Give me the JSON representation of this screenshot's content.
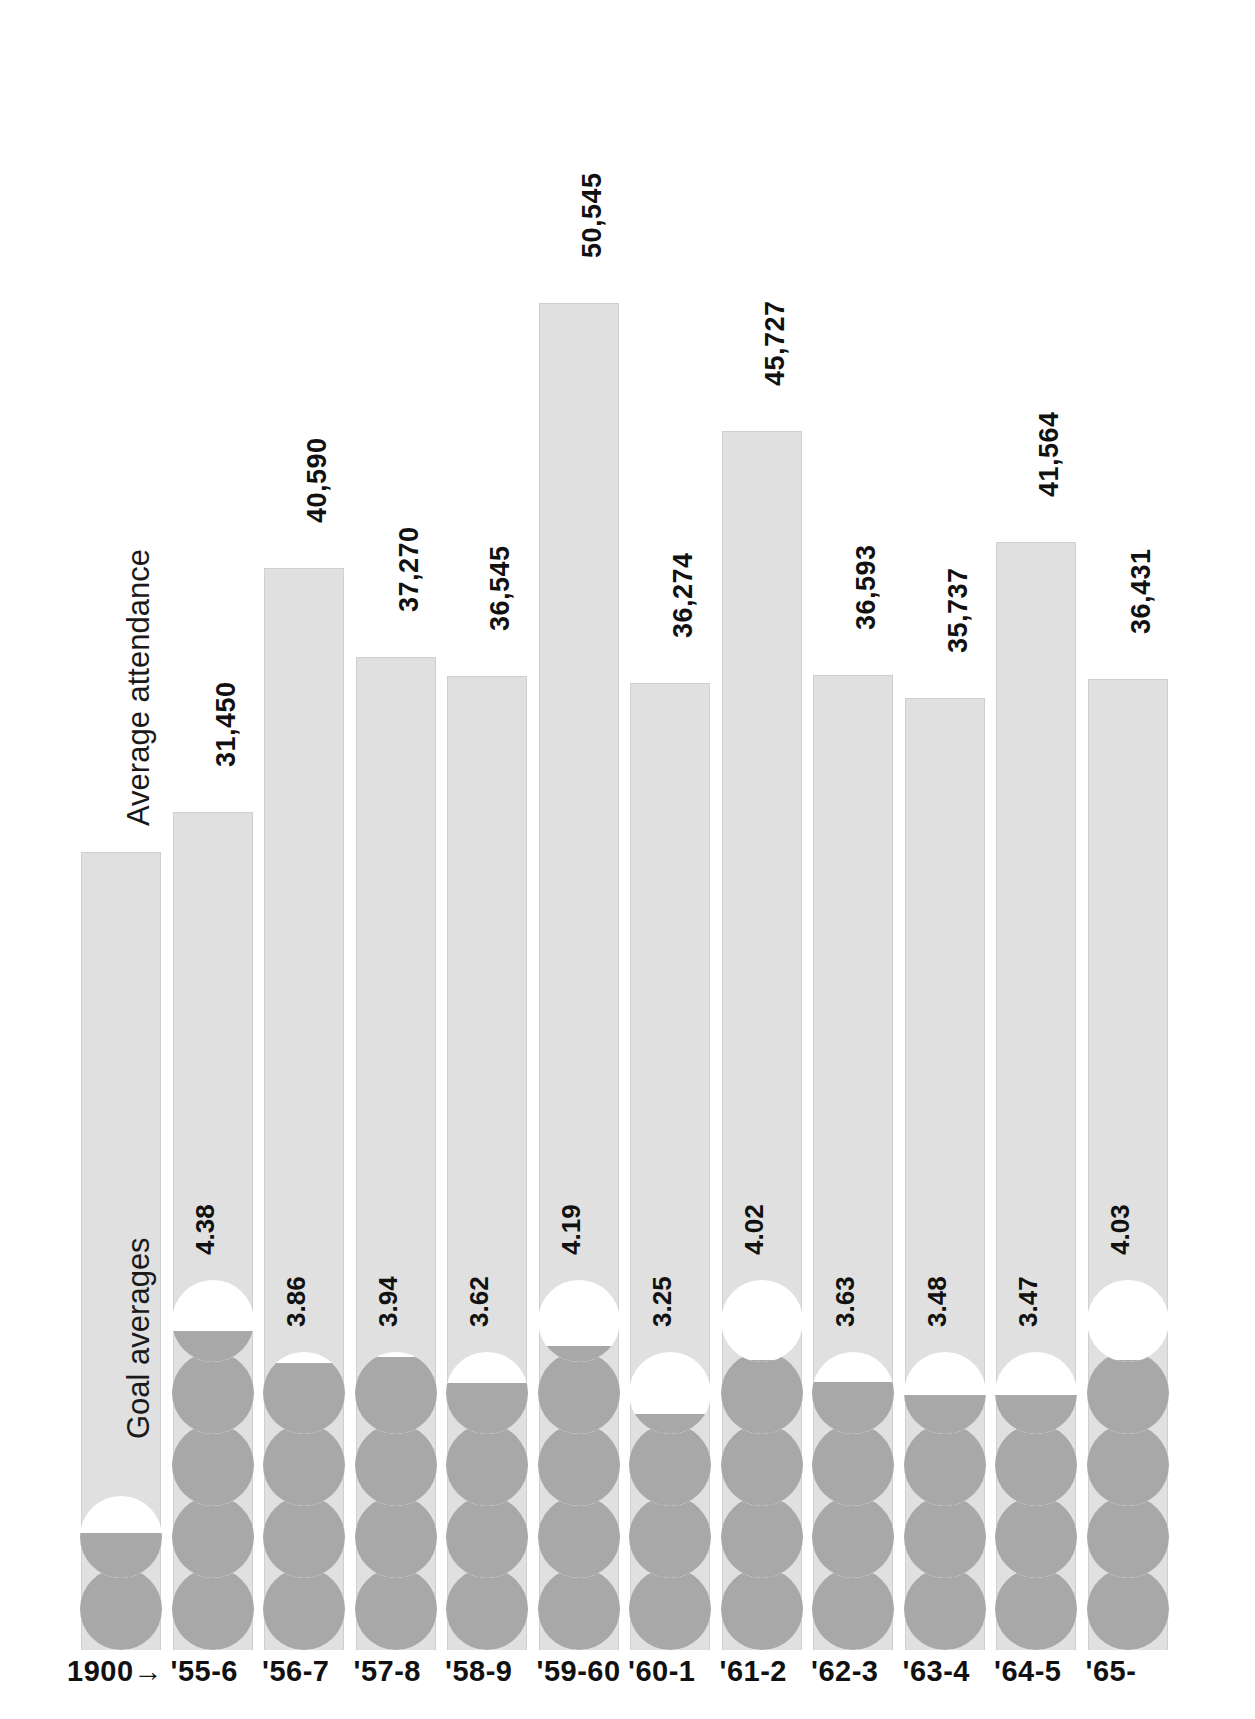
{
  "chart_data": {
    "type": "bar",
    "title": "",
    "xlabel": "",
    "ylabel": "Average attendance",
    "grid": false,
    "legend_position": "in-plot-first-column",
    "axis_note": "1900→",
    "series_labels": {
      "attendance": "Average attendance",
      "goals": "Goal averages"
    },
    "categories": [
      "1900→",
      "'55-6",
      "'56-7",
      "'57-8",
      "'58-9",
      "'59-60",
      "'60-1",
      "'61-2",
      "'62-3",
      "'63-4",
      "'64-5",
      "'65-"
    ],
    "attendance": [
      null,
      31450,
      40590,
      37270,
      36545,
      50545,
      36274,
      45727,
      36593,
      35737,
      41564,
      36431
    ],
    "attendance_labels": [
      "",
      "31,450",
      "40,590",
      "37,270",
      "36,545",
      "50,545",
      "36,274",
      "45,727",
      "36,593",
      "35,737",
      "41,564",
      "36,431"
    ],
    "goal_averages": [
      null,
      4.38,
      3.86,
      3.94,
      3.62,
      4.19,
      3.25,
      4.02,
      3.63,
      3.48,
      3.47,
      4.03
    ],
    "goal_labels": [
      "",
      "4.38",
      "3.86",
      "3.94",
      "3.62",
      "4.19",
      "3.25",
      "4.02",
      "3.63",
      "3.48",
      "3.47",
      "4.03"
    ],
    "ylim": [
      0,
      57000
    ],
    "goal_symbol": "one circle = one goal; partial fill = fractional goal average",
    "colors": {
      "bar": "#e0e0e0",
      "bar_border": "#cfcfcf",
      "circle_fill": "#a8a8a8",
      "circle_empty": "#ffffff",
      "text": "#111111",
      "background": "#ffffff"
    }
  },
  "columns": [
    {
      "key": "legend",
      "xlabel": "1900→",
      "attendance_label": "",
      "goal_label": ""
    },
    {
      "key": "1955-56",
      "xlabel": "'55-6",
      "attendance_label": "31,450",
      "goal_label": "4.38"
    },
    {
      "key": "1956-57",
      "xlabel": "'56-7",
      "attendance_label": "40,590",
      "goal_label": "3.86"
    },
    {
      "key": "1957-58",
      "xlabel": "'57-8",
      "attendance_label": "37,270",
      "goal_label": "3.94"
    },
    {
      "key": "1958-59",
      "xlabel": "'58-9",
      "attendance_label": "36,545",
      "goal_label": "3.62"
    },
    {
      "key": "1959-60",
      "xlabel": "'59-60",
      "attendance_label": "50,545",
      "goal_label": "4.19"
    },
    {
      "key": "1960-61",
      "xlabel": "'60-1",
      "attendance_label": "36,274",
      "goal_label": "3.25"
    },
    {
      "key": "1961-62",
      "xlabel": "'61-2",
      "attendance_label": "45,727",
      "goal_label": "4.02"
    },
    {
      "key": "1962-63",
      "xlabel": "'62-3",
      "attendance_label": "36,593",
      "goal_label": "3.63"
    },
    {
      "key": "1963-64",
      "xlabel": "'63-4",
      "attendance_label": "35,737",
      "goal_label": "3.48"
    },
    {
      "key": "1964-65",
      "xlabel": "'64-5",
      "attendance_label": "41,564",
      "goal_label": "3.47"
    },
    {
      "key": "1965-66",
      "xlabel": "'65-",
      "attendance_label": "36,431",
      "goal_label": "4.03"
    }
  ],
  "legend": {
    "attendance_caption": "Average attendance",
    "goals_caption": "Goal averages",
    "axis_origin": "1900→"
  }
}
